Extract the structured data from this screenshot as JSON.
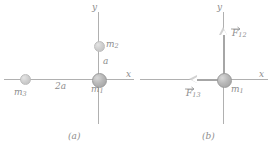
{
  "figure": {
    "type": "physics-diagram",
    "panels": [
      {
        "id": "a",
        "caption": "(a)",
        "axes": {
          "x_label": "x",
          "y_label": "y"
        },
        "masses": [
          {
            "name": "m1-panel-a",
            "label": "m",
            "sub": "1",
            "position": "origin",
            "size": "large"
          },
          {
            "name": "m2-panel-a",
            "label": "m",
            "sub": "2",
            "position": "above-origin-on-y-axis",
            "size": "small"
          },
          {
            "name": "m3-panel-a",
            "label": "m",
            "sub": "3",
            "position": "left-of-origin-on-x-axis",
            "size": "small"
          }
        ],
        "distances": [
          {
            "name": "distance-a",
            "label": "a",
            "between": "m1-m2"
          },
          {
            "name": "distance-2a",
            "label": "2a",
            "between": "m1-m3"
          }
        ]
      },
      {
        "id": "b",
        "caption": "(b)",
        "axes": {
          "x_label": "x",
          "y_label": "y"
        },
        "masses": [
          {
            "name": "m1-panel-b",
            "label": "m",
            "sub": "1",
            "position": "origin",
            "size": "large"
          }
        ],
        "forces": [
          {
            "name": "force-f12",
            "label": "F",
            "sub": "12",
            "direction": "up",
            "vector": true
          },
          {
            "name": "force-f13",
            "label": "F",
            "sub": "13",
            "direction": "left",
            "vector": true
          }
        ]
      }
    ]
  },
  "colors": {
    "axis": "#b0b0b0",
    "mass_fill": "#b9b9b9",
    "arrow": "#a6a6a6",
    "text": "#8d8d8d"
  }
}
